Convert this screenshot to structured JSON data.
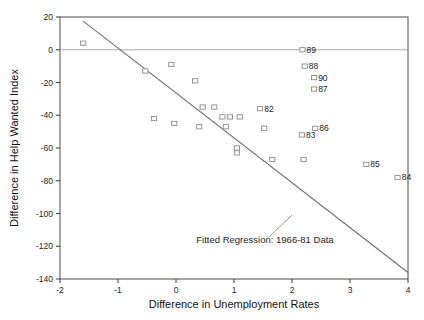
{
  "chart_data": {
    "type": "scatter",
    "title": "",
    "xlabel": "Difference in Unemployment Rates",
    "ylabel": "Difference in Help Wanted Index",
    "xlim": [
      -2,
      4
    ],
    "ylim": [
      -140,
      20
    ],
    "xticks": [
      -2,
      -1,
      0,
      1,
      2,
      3,
      4
    ],
    "xtick_labels": [
      "-2",
      "-1",
      "0",
      "1",
      "2",
      "3",
      "4"
    ],
    "yticks": [
      20,
      0,
      -20,
      -40,
      -60,
      -80,
      -100,
      -120,
      -140
    ],
    "ytick_labels": [
      "20",
      "0",
      "-20",
      "-40",
      "-60",
      "-80",
      "-100",
      "-120",
      "-140"
    ],
    "grid": false,
    "legend": "none",
    "marker_style": "open-square",
    "zero_reference_line": 0,
    "annotations": [
      {
        "text": "Fitted Regression: 1966-81 Data",
        "x": 0.35,
        "y": -118,
        "pointer_from_x": 1.55,
        "pointer_from_y": -116,
        "pointer_to_x": 2.0,
        "pointer_to_y": -101
      }
    ],
    "fit_line": {
      "name": "Fitted Regression 1966-81",
      "x_start": -1.6,
      "y_start": 17.5,
      "x_end": 4.0,
      "y_end": -136.0,
      "color": "#6d6d6d"
    },
    "points": [
      {
        "label": "",
        "x": -1.6,
        "y": 4
      },
      {
        "label": "",
        "x": -0.53,
        "y": -13
      },
      {
        "label": "",
        "x": -0.08,
        "y": -9
      },
      {
        "label": "",
        "x": 0.33,
        "y": -19
      },
      {
        "label": "",
        "x": -0.38,
        "y": -42
      },
      {
        "label": "",
        "x": -0.03,
        "y": -45
      },
      {
        "label": "",
        "x": 0.46,
        "y": -35
      },
      {
        "label": "",
        "x": 0.66,
        "y": -35
      },
      {
        "label": "",
        "x": 0.8,
        "y": -41
      },
      {
        "label": "",
        "x": 0.86,
        "y": -47
      },
      {
        "label": "",
        "x": 0.93,
        "y": -41
      },
      {
        "label": "",
        "x": 0.4,
        "y": -47
      },
      {
        "label": "",
        "x": 1.1,
        "y": -41
      },
      {
        "label": "",
        "x": 1.05,
        "y": -63
      },
      {
        "label": "",
        "x": 1.05,
        "y": -60
      },
      {
        "label": "",
        "x": 1.52,
        "y": -48
      },
      {
        "label": "",
        "x": 1.66,
        "y": -67
      },
      {
        "label": "82",
        "x": 1.45,
        "y": -36
      },
      {
        "label": "83",
        "x": 2.17,
        "y": -52
      },
      {
        "label": "86",
        "x": 2.4,
        "y": -48
      },
      {
        "label": "",
        "x": 2.2,
        "y": -67
      },
      {
        "label": "89",
        "x": 2.18,
        "y": 0
      },
      {
        "label": "88",
        "x": 2.22,
        "y": -10
      },
      {
        "label": "90",
        "x": 2.38,
        "y": -17
      },
      {
        "label": "87",
        "x": 2.38,
        "y": -24
      },
      {
        "label": "85",
        "x": 3.28,
        "y": -70
      },
      {
        "label": "84",
        "x": 3.82,
        "y": -78
      }
    ]
  }
}
